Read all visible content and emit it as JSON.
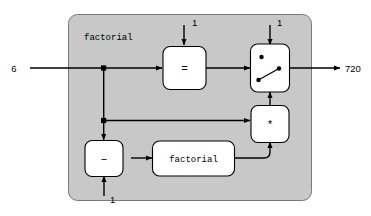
{
  "diagram": {
    "title_label": "factorial",
    "input_value": "6",
    "output_value": "720",
    "colors": {
      "container_fill": "#c8c8c8",
      "container_stroke": "#7a7a7a",
      "box_fill": "#ffffff",
      "wire": "#000000"
    },
    "blocks": [
      {
        "id": "equals",
        "label": "=",
        "name": "equality-test-block"
      },
      {
        "id": "switch",
        "label": "",
        "name": "switch-block"
      },
      {
        "id": "multiply",
        "label": "*",
        "name": "multiply-block"
      },
      {
        "id": "subtract",
        "label": "−",
        "name": "subtract-block"
      },
      {
        "id": "recurse",
        "label": "factorial",
        "name": "recursive-factorial-block"
      }
    ],
    "constants": [
      {
        "id": "const-equals",
        "value": "1",
        "name": "constant-one-equals"
      },
      {
        "id": "const-switch",
        "value": "1",
        "name": "constant-one-switch"
      },
      {
        "id": "const-subtract",
        "value": "1",
        "name": "constant-one-subtract"
      }
    ]
  }
}
